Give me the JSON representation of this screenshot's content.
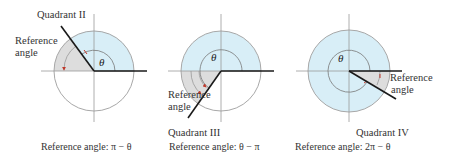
{
  "colors": {
    "circle_fill": "#d8eef7",
    "circle_stroke": "#a8a8a8",
    "reference_fill": "#dddddd",
    "axis": "#9a9a9a",
    "terminal_side": "#1a1a1a",
    "arrow": "#c0392b"
  },
  "diagrams": [
    {
      "quadrant_label": "Quadrant II",
      "reference_label_line1": "Reference",
      "reference_label_line2": "angle",
      "theta_label": "θ",
      "caption": "Reference angle: π − θ"
    },
    {
      "quadrant_label": "Quadrant III",
      "reference_label_line1": "Reference",
      "reference_label_line2": "angle",
      "theta_label": "θ",
      "caption": "Reference angle: θ − π"
    },
    {
      "quadrant_label": "Quadrant IV",
      "reference_label_line1": "Reference",
      "reference_label_line2": "angle",
      "theta_label": "θ",
      "caption": "Reference angle: 2π − θ"
    }
  ]
}
